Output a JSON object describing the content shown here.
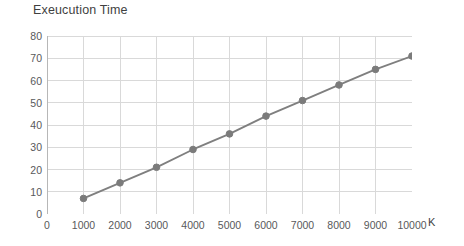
{
  "chart_data": {
    "type": "line",
    "title": "Exeucution Time",
    "xlabel": "K",
    "ylabel": "",
    "x": [
      1000,
      2000,
      3000,
      4000,
      5000,
      6000,
      7000,
      8000,
      9000,
      10000
    ],
    "values": [
      7,
      14,
      21,
      29,
      36,
      44,
      51,
      58,
      65,
      71
    ],
    "series": [
      {
        "name": "Exeucution Time",
        "values": [
          7,
          14,
          21,
          29,
          36,
          44,
          51,
          58,
          65,
          71
        ]
      }
    ],
    "xlim": [
      0,
      10000
    ],
    "ylim": [
      0,
      80
    ],
    "x_ticks": [
      0,
      1000,
      2000,
      3000,
      4000,
      5000,
      6000,
      7000,
      8000,
      9000,
      10000
    ],
    "x_tick_labels": [
      "0",
      "1000",
      "2000",
      "3000",
      "4000",
      "5000",
      "6000",
      "7000",
      "8000",
      "9000",
      "10000"
    ],
    "y_ticks": [
      0,
      10,
      20,
      30,
      40,
      50,
      60,
      70,
      80
    ],
    "y_tick_labels": [
      "0",
      "10",
      "20",
      "30",
      "40",
      "50",
      "60",
      "70",
      "80"
    ],
    "grid": true,
    "grid_x": true,
    "grid_y": true,
    "legend": false,
    "legend_position": "none",
    "marker": "circle",
    "line_color": "#7f7f7f",
    "marker_color": "#7b7b7b",
    "grid_color": "#d9d9d9",
    "axis_color": "#b7b7b7",
    "background": "#ffffff",
    "text_color": "#58595b"
  }
}
